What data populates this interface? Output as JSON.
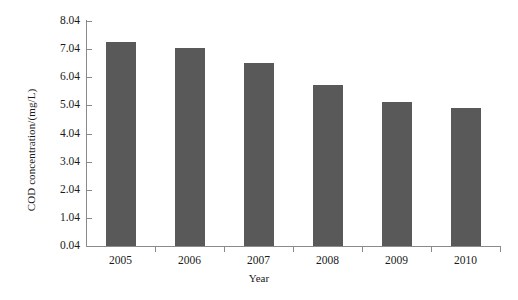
{
  "chart_data": {
    "type": "bar",
    "title": "",
    "xlabel": "Year",
    "ylabel": "COD concentration/(mg/L)",
    "categories": [
      "2005",
      "2006",
      "2007",
      "2008",
      "2009",
      "2010"
    ],
    "values": [
      7.29,
      7.08,
      6.54,
      5.77,
      5.17,
      4.96
    ],
    "series": [
      {
        "name": "COD concentration",
        "values": [
          7.29,
          7.08,
          6.54,
          5.77,
          5.17,
          4.96
        ]
      }
    ],
    "ylim": [
      0.04,
      8.04
    ],
    "ytick_labels": [
      "0.04",
      "1.04",
      "2.04",
      "3.04",
      "4.04",
      "5.04",
      "6.04",
      "7.04",
      "8.04"
    ],
    "ytick_values": [
      0.04,
      1.04,
      2.04,
      3.04,
      4.04,
      5.04,
      6.04,
      7.04,
      8.04
    ],
    "grid": false,
    "legend": "none",
    "bar_color": "#595959",
    "axis_color": "#8a8a8a",
    "background_color": "#ffffff"
  }
}
